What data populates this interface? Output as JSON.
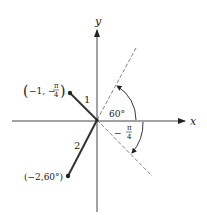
{
  "diagram": {
    "axes": {
      "x_label": "x",
      "y_label": "y"
    },
    "points": [
      {
        "id": 1,
        "segment_label": "1",
        "coord_label": "(−1, −π/4)",
        "r": "-1",
        "theta": "-π/4"
      },
      {
        "id": 2,
        "segment_label": "2",
        "coord_label": "(−2,60°)",
        "r": "-2",
        "theta": "60°"
      }
    ],
    "angles": [
      {
        "label": "60°",
        "direction": "counterclockwise"
      },
      {
        "label_num": "π",
        "label_den": "4",
        "label_sign": "−",
        "label": "−π/4",
        "direction": "clockwise"
      }
    ],
    "colors": {
      "ink": "#222222",
      "dashed": "#555555",
      "background": "#ffffff"
    }
  }
}
